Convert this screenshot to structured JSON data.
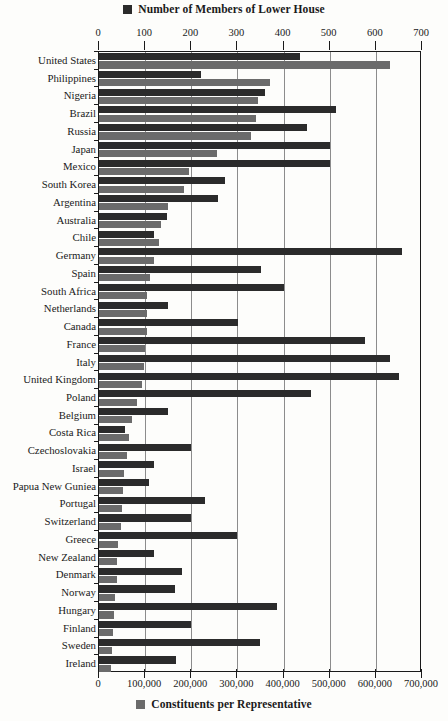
{
  "legend_top": {
    "label": "Number of Members of Lower House",
    "color": "#2b2b2b",
    "swatch_name": "dark-square-swatch"
  },
  "legend_bottom": {
    "label": "Constituents per Representative",
    "color": "#6b6b6b",
    "swatch_name": "gray-square-swatch"
  },
  "chart_data": {
    "type": "bar",
    "orientation": "horizontal",
    "title": "",
    "grid": true,
    "legend_position": "top and bottom, centered",
    "categories": [
      "United States",
      "Philippines",
      "Nigeria",
      "Brazil",
      "Russia",
      "Japan",
      "Mexico",
      "South Korea",
      "Argentina",
      "Australia",
      "Chile",
      "Germany",
      "Spain",
      "South Africa",
      "Netherlands",
      "Canada",
      "France",
      "Italy",
      "United Kingdom",
      "Poland",
      "Belgium",
      "Costa Rica",
      "Czechoslovakia",
      "Israel",
      "Papua New Guniea",
      "Portugal",
      "Switzerland",
      "Greece",
      "New Zealand",
      "Denmark",
      "Norway",
      "Hungary",
      "Finland",
      "Sweden",
      "Ireland"
    ],
    "series": [
      {
        "name": "Number of Members of Lower House",
        "color": "#2b2b2b",
        "axis": "top",
        "values": [
          435,
          220,
          360,
          513,
          450,
          500,
          500,
          273,
          257,
          148,
          120,
          656,
          350,
          400,
          150,
          301,
          577,
          630,
          651,
          460,
          150,
          57,
          200,
          120,
          109,
          230,
          200,
          300,
          120,
          179,
          165,
          386,
          200,
          349,
          166
        ]
      },
      {
        "name": "Constituents per Representative",
        "color": "#6b6b6b",
        "axis": "bottom",
        "values": [
          630000,
          370000,
          345000,
          340000,
          330000,
          255000,
          195000,
          185000,
          150000,
          135000,
          130000,
          120000,
          110000,
          105000,
          105000,
          105000,
          100000,
          97000,
          93000,
          82000,
          72000,
          65000,
          60000,
          55000,
          52000,
          50000,
          48000,
          42000,
          40000,
          38000,
          35000,
          33000,
          30000,
          28000,
          26000
        ]
      }
    ],
    "top_axis": {
      "label": "",
      "min": 0,
      "max": 700,
      "tick_step": 100,
      "ticks": [
        "0",
        "100",
        "200",
        "300",
        "400",
        "500",
        "600",
        "700"
      ]
    },
    "bottom_axis": {
      "label": "",
      "min": 0,
      "max": 700000,
      "tick_step": 100000,
      "ticks": [
        "0",
        "100,000",
        "200,000",
        "300,000",
        "400,000",
        "500,000",
        "600,000",
        "700,000"
      ]
    }
  }
}
